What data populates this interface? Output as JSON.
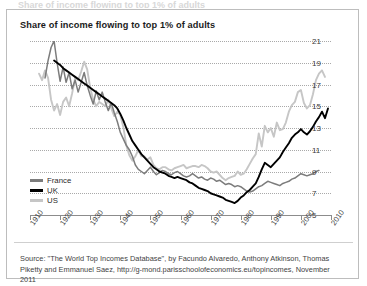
{
  "figure": {
    "ghost_header": "Share of income flowing to top 1% of adults",
    "title": "Share of income flowing to top 1% of adults",
    "source": "Source: \"The World Top Incomes Database\", by Facundo Alvaredo, Anthony Atkinson, Thomas Piketty and Emmanuel Saez, http://g-mond.parisschoolofeconomics.eu/topincomes, November 2011"
  },
  "colors": {
    "france": "#7c7c7c",
    "uk": "#000000",
    "us": "#c6c6c6",
    "gridline": "#a9a9a9",
    "axis": "#8c8c8c",
    "border": "#bdbdbd",
    "text": "#1b1b1b"
  },
  "legend": [
    {
      "label": "France",
      "color": "#7c7c7c"
    },
    {
      "label": "UK",
      "color": "#000000"
    },
    {
      "label": "US",
      "color": "#c6c6c6"
    }
  ],
  "chart_data": {
    "type": "line",
    "title": "Share of income flowing to top 1% of adults",
    "xlabel": "",
    "ylabel": "",
    "xlim": [
      1910,
      2010
    ],
    "ylim": [
      5,
      21
    ],
    "yticks": [
      5,
      7,
      9,
      11,
      13,
      15,
      17,
      19,
      21
    ],
    "xticks": [
      1910,
      1920,
      1930,
      1940,
      1950,
      1960,
      1970,
      1980,
      1990,
      2000,
      2010
    ],
    "grid": true,
    "legend_position": "bottom-left",
    "units": "percent",
    "series": [
      {
        "name": "France",
        "color": "#7c7c7c",
        "x": [
          1915,
          1916,
          1917,
          1918,
          1919,
          1920,
          1921,
          1922,
          1923,
          1924,
          1925,
          1926,
          1927,
          1928,
          1929,
          1930,
          1931,
          1932,
          1933,
          1934,
          1935,
          1936,
          1937,
          1938,
          1939,
          1940,
          1941,
          1942,
          1943,
          1944,
          1945,
          1946,
          1947,
          1948,
          1949,
          1950,
          1951,
          1952,
          1953,
          1954,
          1955,
          1956,
          1957,
          1958,
          1959,
          1960,
          1961,
          1962,
          1963,
          1964,
          1965,
          1966,
          1967,
          1968,
          1969,
          1970,
          1971,
          1972,
          1973,
          1974,
          1975,
          1976,
          1977,
          1978,
          1979,
          1980,
          1981,
          1982,
          1983,
          1984,
          1985,
          1986,
          1987,
          1988,
          1989,
          1990,
          1991,
          1992,
          1993,
          1994,
          1995,
          1996,
          1997,
          1998,
          1999,
          2000,
          2001,
          2002,
          2003,
          2004,
          2005,
          2006
        ],
        "y": [
          17.6,
          19.2,
          20.4,
          21.0,
          19.0,
          17.3,
          18.6,
          17.2,
          18.1,
          16.6,
          17.4,
          16.3,
          17.2,
          18.1,
          16.9,
          16.0,
          15.2,
          16.4,
          15.6,
          16.3,
          15.4,
          14.6,
          15.3,
          14.4,
          13.6,
          12.6,
          12.0,
          11.4,
          11.0,
          10.4,
          9.6,
          9.2,
          9.0,
          8.8,
          9.1,
          9.4,
          9.0,
          8.7,
          8.9,
          9.1,
          9.0,
          8.8,
          8.7,
          8.9,
          9.0,
          8.8,
          8.6,
          8.5,
          8.6,
          8.8,
          8.6,
          8.4,
          8.5,
          8.3,
          8.2,
          8.4,
          8.3,
          8.1,
          8.2,
          8.0,
          7.8,
          7.9,
          7.8,
          7.6,
          7.7,
          7.6,
          7.4,
          7.2,
          7.1,
          7.2,
          7.4,
          7.6,
          7.7,
          7.9,
          8.1,
          8.0,
          7.9,
          7.8,
          7.7,
          7.9,
          8.0,
          8.1,
          8.3,
          8.4,
          8.6,
          8.8,
          8.7,
          8.6,
          8.7,
          8.8,
          9.0,
          9.1
        ]
      },
      {
        "name": "UK",
        "color": "#000000",
        "x": [
          1918,
          1919,
          1920,
          1921,
          1922,
          1923,
          1924,
          1925,
          1926,
          1927,
          1928,
          1929,
          1930,
          1931,
          1932,
          1933,
          1934,
          1935,
          1936,
          1937,
          1938,
          1939,
          1940,
          1941,
          1942,
          1943,
          1944,
          1945,
          1946,
          1947,
          1948,
          1949,
          1950,
          1951,
          1952,
          1953,
          1954,
          1955,
          1956,
          1957,
          1958,
          1959,
          1960,
          1961,
          1962,
          1963,
          1964,
          1965,
          1966,
          1967,
          1968,
          1969,
          1970,
          1971,
          1972,
          1973,
          1974,
          1975,
          1976,
          1977,
          1978,
          1979,
          1980,
          1981,
          1982,
          1983,
          1984,
          1985,
          1986,
          1987,
          1988,
          1989,
          1990,
          1991,
          1992,
          1993,
          1994,
          1995,
          1996,
          1997,
          1998,
          1999,
          2000,
          2001,
          2002,
          2003,
          2004,
          2005,
          2006,
          2007,
          2008,
          2009
        ],
        "y": [
          19.2,
          19.0,
          18.8,
          18.5,
          18.3,
          18.1,
          17.9,
          17.7,
          17.5,
          17.3,
          17.1,
          16.9,
          16.7,
          16.5,
          16.3,
          16.1,
          15.9,
          15.7,
          15.5,
          15.3,
          15.1,
          14.8,
          14.3,
          13.7,
          13.0,
          12.4,
          11.8,
          11.4,
          11.0,
          10.6,
          10.3,
          10.0,
          9.7,
          9.4,
          9.2,
          9.0,
          8.9,
          8.8,
          8.6,
          8.5,
          8.4,
          8.5,
          8.4,
          8.3,
          8.2,
          8.0,
          7.9,
          7.7,
          7.5,
          7.4,
          7.3,
          7.2,
          7.0,
          6.9,
          6.8,
          6.7,
          6.6,
          6.4,
          6.3,
          6.2,
          6.1,
          6.3,
          6.6,
          6.8,
          7.1,
          7.3,
          7.6,
          7.9,
          8.5,
          9.2,
          9.8,
          9.6,
          9.4,
          9.7,
          10.0,
          10.3,
          10.8,
          11.2,
          11.6,
          12.1,
          12.4,
          12.6,
          12.9,
          12.6,
          12.4,
          12.7,
          13.1,
          13.6,
          14.0,
          14.5,
          13.9,
          14.8
        ]
      },
      {
        "name": "US",
        "color": "#c6c6c6",
        "x": [
          1913,
          1914,
          1915,
          1916,
          1917,
          1918,
          1919,
          1920,
          1921,
          1922,
          1923,
          1924,
          1925,
          1926,
          1927,
          1928,
          1929,
          1930,
          1931,
          1932,
          1933,
          1934,
          1935,
          1936,
          1937,
          1938,
          1939,
          1940,
          1941,
          1942,
          1943,
          1944,
          1945,
          1946,
          1947,
          1948,
          1949,
          1950,
          1951,
          1952,
          1953,
          1954,
          1955,
          1956,
          1957,
          1958,
          1959,
          1960,
          1961,
          1962,
          1963,
          1964,
          1965,
          1966,
          1967,
          1968,
          1969,
          1970,
          1971,
          1972,
          1973,
          1974,
          1975,
          1976,
          1977,
          1978,
          1979,
          1980,
          1981,
          1982,
          1983,
          1984,
          1985,
          1986,
          1987,
          1988,
          1989,
          1990,
          1991,
          1992,
          1993,
          1994,
          1995,
          1996,
          1997,
          1998,
          1999,
          2000,
          2001,
          2002,
          2003,
          2004,
          2005,
          2006,
          2007,
          2008
        ],
        "y": [
          18.0,
          17.4,
          18.3,
          17.6,
          15.6,
          14.6,
          15.2,
          14.2,
          15.4,
          15.8,
          15.0,
          16.2,
          17.6,
          17.4,
          18.2,
          19.1,
          18.4,
          16.7,
          15.6,
          15.0,
          15.4,
          15.2,
          15.0,
          15.6,
          14.8,
          14.1,
          14.5,
          14.2,
          13.1,
          11.4,
          10.5,
          10.0,
          10.4,
          11.0,
          10.4,
          10.4,
          10.1,
          10.3,
          9.6,
          9.3,
          9.2,
          9.4,
          9.4,
          9.2,
          9.1,
          9.3,
          9.4,
          9.5,
          9.6,
          9.3,
          9.4,
          9.5,
          9.5,
          9.4,
          9.6,
          9.5,
          9.3,
          9.0,
          8.9,
          9.0,
          8.7,
          8.4,
          8.2,
          8.4,
          8.5,
          8.6,
          9.0,
          8.7,
          8.8,
          9.2,
          9.7,
          10.2,
          10.6,
          12.5,
          11.3,
          13.2,
          12.6,
          13.0,
          12.2,
          13.5,
          12.8,
          12.9,
          13.5,
          14.5,
          15.1,
          15.4,
          16.3,
          16.5,
          15.3,
          14.8,
          15.1,
          16.1,
          17.4,
          18.0,
          18.3,
          17.7
        ]
      }
    ]
  },
  "axes": {
    "ytick_labels": [
      "21",
      "19",
      "17",
      "15",
      "13",
      "11",
      "9",
      "7",
      "5"
    ],
    "xtick_labels": [
      "1910",
      "1920",
      "1930",
      "1940",
      "1950",
      "1960",
      "1970",
      "1980",
      "1990",
      "2000",
      "2010"
    ]
  }
}
